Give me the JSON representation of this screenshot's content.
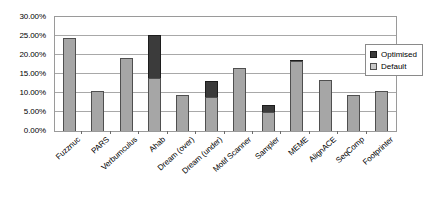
{
  "chart_data": {
    "type": "bar",
    "stacked": true,
    "title": "",
    "xlabel": "",
    "ylabel": "",
    "ylim": [
      0,
      30
    ],
    "ytick_labels": [
      "0.00%",
      "5.00%",
      "10.00%",
      "15.00%",
      "20.00%",
      "25.00%",
      "30.00%"
    ],
    "ytick_values": [
      0,
      5,
      10,
      15,
      20,
      25,
      30
    ],
    "grid": true,
    "legend_position": "right",
    "categories": [
      "Fuzznuc",
      "PARS",
      "Verbumculus",
      "Ahab",
      "Dream (over)",
      "Dream (under)",
      "Motif Scanner",
      "Sampler",
      "MEME",
      "AlignACE",
      "SeqComp",
      "Footprinter"
    ],
    "series": [
      {
        "name": "Default",
        "color": "#a6a6a6",
        "values": [
          24.5,
          10.4,
          19.2,
          14.0,
          9.4,
          8.9,
          16.7,
          5.0,
          18.3,
          13.3,
          9.6,
          10.6
        ]
      },
      {
        "name": "Optimised",
        "color": "#3b3b3b",
        "values": [
          0,
          0,
          0,
          11.3,
          0,
          4.2,
          0,
          1.8,
          0.5,
          0,
          0,
          0
        ]
      }
    ],
    "totals": [
      24.5,
      10.4,
      19.2,
      25.3,
      9.4,
      13.1,
      16.7,
      6.8,
      18.8,
      13.3,
      9.6,
      10.6
    ]
  },
  "legend": {
    "items": [
      {
        "label": "Optimised",
        "swatch": "dark-swatch"
      },
      {
        "label": "Default",
        "swatch": "light-swatch"
      }
    ]
  }
}
